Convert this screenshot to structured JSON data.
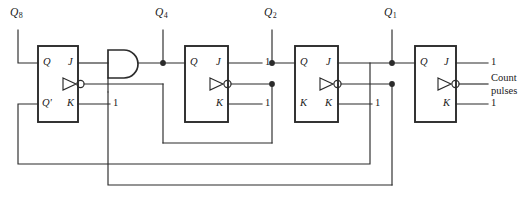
{
  "figure": {
    "type": "logic-circuit-diagram",
    "background": "#ffffff",
    "ink": "#2b2b2b"
  },
  "outputs": [
    {
      "name": "Q8",
      "base": "Q",
      "sub": "8",
      "x": 18
    },
    {
      "name": "Q4",
      "base": "Q",
      "sub": "4",
      "x": 163
    },
    {
      "name": "Q2",
      "base": "Q",
      "sub": "2",
      "x": 272
    },
    {
      "name": "Q1",
      "base": "Q",
      "sub": "1",
      "x": 392
    }
  ],
  "flipflops": [
    {
      "id": "ff-q8",
      "pins": {
        "left_top": "Q",
        "left_bottom": "Q'",
        "right_top": "J",
        "right_bottom": "K"
      },
      "j_input": "",
      "k_input": "1",
      "clock_input": ""
    },
    {
      "id": "ff-q4",
      "pins": {
        "left_top": "Q",
        "left_bottom": "",
        "right_top": "J",
        "right_bottom": "K"
      },
      "j_input": "1",
      "k_input": "1",
      "clock_input": ""
    },
    {
      "id": "ff-q2",
      "pins": {
        "left_top": "Q",
        "left_bottom": "K",
        "right_top": "J",
        "right_bottom": "K"
      },
      "j_input": "",
      "k_input": "1",
      "clock_input": ""
    },
    {
      "id": "ff-q1",
      "pins": {
        "left_top": "Q",
        "left_bottom": "",
        "right_top": "J",
        "right_bottom": "K"
      },
      "j_input": "1",
      "k_input": "1",
      "clock_input": "Count pulses"
    }
  ],
  "gates": [
    {
      "id": "and-gate-1",
      "type": "AND",
      "inputs": 2,
      "label": ""
    }
  ],
  "clock": {
    "source_label_line1": "Count",
    "source_label_line2": "pulses"
  },
  "logic_one": "1"
}
